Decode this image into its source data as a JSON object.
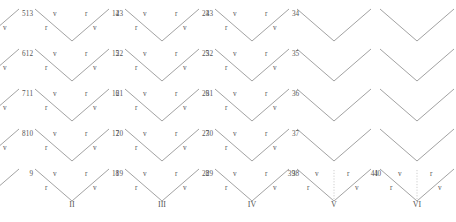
{
  "figure": {
    "title": "",
    "edge_color": "#8a8a8a",
    "dotted_color": "#b9b9b9",
    "text_color": "#555555",
    "columns": [
      {
        "name": "I",
        "x": 20,
        "cells": [
          {
            "row": 0,
            "y": 8,
            "num_left": "4",
            "num_right": "5",
            "tl": "v",
            "tr": "r",
            "bl": "r",
            "br": "v",
            "dotted": false
          },
          {
            "row": 1,
            "y": 48,
            "num_left": "3",
            "num_right": "6",
            "tl": "v",
            "tr": "r",
            "bl": "r",
            "br": "v",
            "dotted": false
          },
          {
            "row": 2,
            "y": 88,
            "num_left": "2",
            "num_right": "7",
            "tl": "v",
            "tr": "r",
            "bl": "r",
            "br": "v",
            "dotted": false
          },
          {
            "row": 3,
            "y": 128,
            "num_left": "1",
            "num_right": "8",
            "tl": "v",
            "tr": "r",
            "bl": "r",
            "br": "v",
            "dotted": false
          },
          {
            "row": 4,
            "y": 168,
            "num_left": "",
            "num_right": "",
            "tl": "",
            "tr": "",
            "bl": "",
            "br": "",
            "dotted": false
          }
        ]
      },
      {
        "name": "II",
        "x": 110,
        "cells": [
          {
            "row": 0,
            "y": 8,
            "num_left": "13",
            "num_right": "14",
            "tl": "v",
            "tr": "r",
            "bl": "r",
            "br": "v",
            "dotted": false
          },
          {
            "row": 1,
            "y": 48,
            "num_left": "12",
            "num_right": "15",
            "tl": "v",
            "tr": "r",
            "bl": "r",
            "br": "v",
            "dotted": false
          },
          {
            "row": 2,
            "y": 88,
            "num_left": "11",
            "num_right": "16",
            "tl": "v",
            "tr": "r",
            "bl": "r",
            "br": "v",
            "dotted": false
          },
          {
            "row": 3,
            "y": 128,
            "num_left": "10",
            "num_right": "17",
            "tl": "v",
            "tr": "r",
            "bl": "r",
            "br": "v",
            "dotted": false
          },
          {
            "row": 4,
            "y": 168,
            "num_left": "9",
            "num_right": "18",
            "tl": "v",
            "tr": "r",
            "bl": "r",
            "br": "v",
            "dotted": false
          }
        ]
      },
      {
        "name": "III",
        "x": 200,
        "cells": [
          {
            "row": 0,
            "y": 8,
            "num_left": "23",
            "num_right": "24",
            "tl": "v",
            "tr": "r",
            "bl": "r",
            "br": "v",
            "dotted": false
          },
          {
            "row": 1,
            "y": 48,
            "num_left": "22",
            "num_right": "25",
            "tl": "v",
            "tr": "r",
            "bl": "r",
            "br": "v",
            "dotted": false
          },
          {
            "row": 2,
            "y": 88,
            "num_left": "21",
            "num_right": "26",
            "tl": "v",
            "tr": "r",
            "bl": "r",
            "br": "v",
            "dotted": false
          },
          {
            "row": 3,
            "y": 128,
            "num_left": "20",
            "num_right": "27",
            "tl": "v",
            "tr": "r",
            "bl": "r",
            "br": "v",
            "dotted": false
          },
          {
            "row": 4,
            "y": 168,
            "num_left": "19",
            "num_right": "28",
            "tl": "v",
            "tr": "r",
            "bl": "r",
            "br": "v",
            "dotted": false
          }
        ]
      },
      {
        "name": "IV",
        "x": 290,
        "cells": [
          {
            "row": 0,
            "y": 8,
            "num_left": "33",
            "num_right": "34",
            "tl": "v",
            "tr": "r",
            "bl": "r",
            "br": "v",
            "dotted": false
          },
          {
            "row": 1,
            "y": 48,
            "num_left": "32",
            "num_right": "35",
            "tl": "v",
            "tr": "r",
            "bl": "r",
            "br": "v",
            "dotted": false
          },
          {
            "row": 2,
            "y": 88,
            "num_left": "31",
            "num_right": "36",
            "tl": "v",
            "tr": "r",
            "bl": "r",
            "br": "v",
            "dotted": false
          },
          {
            "row": 3,
            "y": 128,
            "num_left": "30",
            "num_right": "37",
            "tl": "v",
            "tr": "r",
            "bl": "r",
            "br": "v",
            "dotted": false
          },
          {
            "row": 4,
            "y": 168,
            "num_left": "29",
            "num_right": "38",
            "tl": "v",
            "tr": "r",
            "bl": "r",
            "br": "v",
            "dotted": false
          }
        ]
      },
      {
        "name": "V",
        "x": 372,
        "cells": [
          {
            "row": 0,
            "y": 8,
            "num_left": "",
            "num_right": "",
            "tl": "",
            "tr": "",
            "bl": "",
            "br": "",
            "dotted": false
          },
          {
            "row": 1,
            "y": 48,
            "num_left": "",
            "num_right": "",
            "tl": "",
            "tr": "",
            "bl": "",
            "br": "",
            "dotted": false
          },
          {
            "row": 2,
            "y": 88,
            "num_left": "",
            "num_right": "",
            "tl": "",
            "tr": "",
            "bl": "",
            "br": "",
            "dotted": false
          },
          {
            "row": 3,
            "y": 128,
            "num_left": "",
            "num_right": "",
            "tl": "",
            "tr": "",
            "bl": "",
            "br": "",
            "dotted": false
          },
          {
            "row": 4,
            "y": 168,
            "num_left": "39",
            "num_right": "40",
            "tl": "v",
            "tr": "r",
            "bl": "r",
            "br": "v",
            "dotted": true
          }
        ]
      },
      {
        "name": "VI",
        "x": 455,
        "cells": [
          {
            "row": 0,
            "y": 8,
            "num_left": "",
            "num_right": "",
            "tl": "",
            "tr": "",
            "bl": "",
            "br": "",
            "dotted": false
          },
          {
            "row": 1,
            "y": 48,
            "num_left": "",
            "num_right": "",
            "tl": "",
            "tr": "",
            "bl": "",
            "br": "",
            "dotted": false
          },
          {
            "row": 2,
            "y": 88,
            "num_left": "",
            "num_right": "",
            "tl": "",
            "tr": "",
            "bl": "",
            "br": "",
            "dotted": false
          },
          {
            "row": 3,
            "y": 128,
            "num_left": "",
            "num_right": "",
            "tl": "",
            "tr": "",
            "bl": "",
            "br": "",
            "dotted": false
          },
          {
            "row": 4,
            "y": 168,
            "num_left": "41",
            "num_right": "42",
            "tl": "v",
            "tr": "r",
            "bl": "r",
            "br": "v",
            "dotted": true
          }
        ]
      }
    ]
  }
}
